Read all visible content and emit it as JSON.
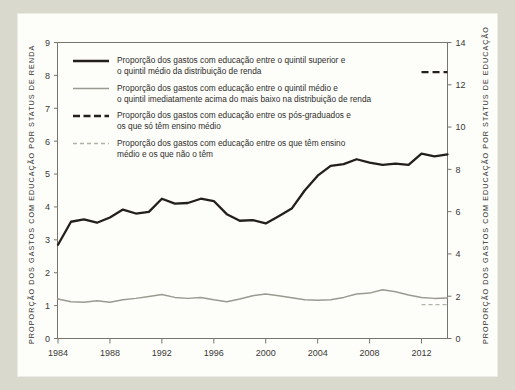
{
  "figure": {
    "background_color": "#fdfdfa",
    "page_background_color": "#d9d9cd",
    "axis_color": "#76766e"
  },
  "chart_data": {
    "type": "line",
    "title": "",
    "xlabel": "",
    "ylabel": "PROPORÇÃO DOS GASTOS COM EDUCAÇÃO POR STATUS DE RENDA",
    "ylabel_right": "PROPORÇÃO DOS GASTOS COM EDUCAÇÃO POR STATUS DE EDUCAÇÃO",
    "grid": false,
    "legend_position": "upper-left-inside",
    "xlim": [
      1984,
      2014
    ],
    "ylim": [
      0,
      9
    ],
    "ylim_right": [
      0,
      14
    ],
    "xticks": [
      1984,
      1988,
      1992,
      1996,
      2000,
      2004,
      2008,
      2012
    ],
    "xtick_labels": [
      "1984",
      "1988",
      "1992",
      "1996",
      "2000",
      "2004",
      "2008",
      "2012"
    ],
    "yticks": [
      0,
      1,
      2,
      3,
      4,
      5,
      6,
      7,
      8,
      9
    ],
    "ytick_labels": [
      "0",
      "1",
      "2",
      "3",
      "4",
      "5",
      "6",
      "7",
      "8",
      "9"
    ],
    "yticks_right": [
      0,
      2,
      4,
      6,
      8,
      10,
      12,
      14
    ],
    "ytick_labels_right": [
      "0",
      "2",
      "4",
      "6",
      "8",
      "10",
      "12",
      "14"
    ],
    "x": [
      1984,
      1985,
      1986,
      1987,
      1988,
      1989,
      1990,
      1991,
      1992,
      1993,
      1994,
      1995,
      1996,
      1997,
      1998,
      1999,
      2000,
      2001,
      2002,
      2003,
      2004,
      2005,
      2006,
      2007,
      2008,
      2009,
      2010,
      2011,
      2012,
      2013,
      2014
    ],
    "series": [
      {
        "name": "Proporção dos gastos com educação entre o quintil superior e o quintil médio da distribuição de renda",
        "short_name": "quintil-superior-vs-medio",
        "color": "#231f1c",
        "style": "solid",
        "width": 2.3,
        "axis": "left",
        "values": [
          2.85,
          3.55,
          3.62,
          3.52,
          3.68,
          3.92,
          3.8,
          3.85,
          4.25,
          4.1,
          4.12,
          4.25,
          4.18,
          3.78,
          3.58,
          3.6,
          3.5,
          3.72,
          3.95,
          4.5,
          4.95,
          5.25,
          5.3,
          5.45,
          5.35,
          5.28,
          5.32,
          5.28,
          5.62,
          5.54,
          5.6
        ]
      },
      {
        "name": "Proporção dos gastos com educação entre o quintil médio e o quintil imediatamente acima do mais baixo na distribuição de renda",
        "short_name": "quintil-medio-vs-segundo",
        "color": "#9a9a90",
        "style": "solid",
        "width": 1.5,
        "axis": "left",
        "values": [
          1.2,
          1.12,
          1.1,
          1.15,
          1.1,
          1.18,
          1.22,
          1.28,
          1.34,
          1.25,
          1.22,
          1.25,
          1.18,
          1.12,
          1.2,
          1.3,
          1.35,
          1.3,
          1.24,
          1.18,
          1.16,
          1.18,
          1.25,
          1.35,
          1.38,
          1.48,
          1.42,
          1.32,
          1.25,
          1.22,
          1.23
        ]
      },
      {
        "name": "Proporção dos gastos com educação entre os pós-graduados e os que só têm ensino médio",
        "short_name": "pos-graduados-vs-ensino-medio",
        "color": "#231f1c",
        "style": "dashed",
        "width": 2.3,
        "axis": "right",
        "x_start": 2012,
        "x_end": 2014,
        "value_right": 12.6,
        "value_left_equivalent": 8.1
      },
      {
        "name": "Proporção dos gastos com educação entre os que têm ensino médio e os que não o têm",
        "short_name": "ensino-medio-vs-sem-ensino-medio",
        "color": "#b3b3a9",
        "style": "dashed",
        "width": 1.4,
        "axis": "right",
        "x_start": 2012,
        "x_end": 2014,
        "value_right": 1.6,
        "value_left_equivalent": 1.03
      }
    ],
    "legend": [
      {
        "line1": "Proporção dos gastos com educação entre o quintil superior e",
        "line2": "o quintil médio da distribuição de renda",
        "swatch": "solid-black-thick"
      },
      {
        "line1": "Proporção dos gastos com educação entre o quintil médio e",
        "line2": "o quintil imediatamente acima do mais baixo na distribuição de renda",
        "swatch": "solid-gray"
      },
      {
        "line1": "Proporção dos gastos com educação entre os pós-graduados e",
        "line2": "os que só têm ensino médio",
        "swatch": "dashed-black-thick"
      },
      {
        "line1": "Proporção dos gastos com educação entre os que têm ensino",
        "line2": "médio e os que não o têm",
        "swatch": "dashed-gray"
      }
    ]
  }
}
